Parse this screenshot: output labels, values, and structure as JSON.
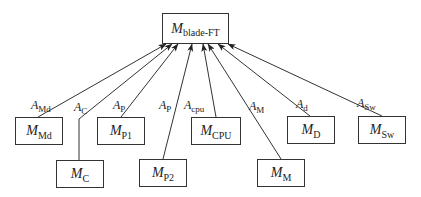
{
  "diagram": {
    "root": {
      "symbol": "M",
      "subscript": "blade-FT"
    },
    "children": [
      {
        "id": "md",
        "symbol": "M",
        "subscript": "Md",
        "edge_label": {
          "symbol": "A",
          "subscript": "Md"
        }
      },
      {
        "id": "c",
        "symbol": "M",
        "subscript": "C",
        "edge_label": {
          "symbol": "A",
          "subscript": "C"
        }
      },
      {
        "id": "p1",
        "symbol": "M",
        "subscript": "P1",
        "edge_label": {
          "symbol": "A",
          "subscript": "P"
        }
      },
      {
        "id": "p2",
        "symbol": "M",
        "subscript": "P2",
        "edge_label": {
          "symbol": "A",
          "subscript": "P"
        }
      },
      {
        "id": "cpu",
        "symbol": "M",
        "subscript": "CPU",
        "edge_label": {
          "symbol": "A",
          "subscript": "cpu"
        }
      },
      {
        "id": "m",
        "symbol": "M",
        "subscript": "M",
        "edge_label": {
          "symbol": "A",
          "subscript": "M"
        }
      },
      {
        "id": "d",
        "symbol": "M",
        "subscript": "D",
        "edge_label": {
          "symbol": "A",
          "subscript": "d"
        }
      },
      {
        "id": "sw",
        "symbol": "M",
        "subscript": "Sw",
        "edge_label": {
          "symbol": "A",
          "subscript": "Sw"
        }
      }
    ],
    "colors": {
      "line": "#333333",
      "background": "#ffffff"
    }
  }
}
